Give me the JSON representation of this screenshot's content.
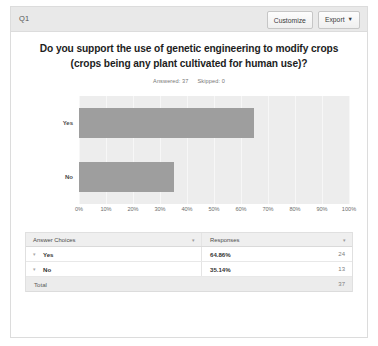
{
  "header": {
    "question_label": "Q1",
    "customize_label": "Customize",
    "export_label": "Export",
    "export_caret": "▼"
  },
  "chart_data": {
    "type": "bar",
    "orientation": "horizontal",
    "title": "Do you support the use of genetic engineering to modify crops (crops being any plant cultivated for human use)?",
    "categories": [
      "Yes",
      "No"
    ],
    "values": [
      64.86,
      35.14
    ],
    "counts": [
      24,
      13
    ],
    "xlabel": "",
    "ylabel": "",
    "xlim": [
      0,
      100
    ],
    "grid": true,
    "legend": false,
    "bar_color": "#9e9e9e",
    "plot_background": "#ededed",
    "tick_labels": [
      "0%",
      "10%",
      "20%",
      "30%",
      "40%",
      "50%",
      "60%",
      "70%",
      "80%",
      "90%",
      "100%"
    ],
    "tick_values": [
      0,
      10,
      20,
      30,
      40,
      50,
      60,
      70,
      80,
      90,
      100
    ],
    "answered_label": "Answered: 37",
    "skipped_label": "Skipped: 0"
  },
  "table": {
    "columns": [
      "Answer Choices",
      "Responses"
    ],
    "sort_caret": "▾",
    "row_caret": "▾",
    "rows": [
      {
        "choice": "Yes",
        "percent": "64.86%",
        "count": "24"
      },
      {
        "choice": "No",
        "percent": "35.14%",
        "count": "13"
      }
    ],
    "total_label": "Total",
    "total_count": "37"
  }
}
